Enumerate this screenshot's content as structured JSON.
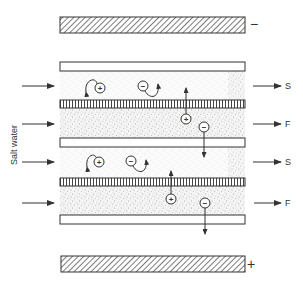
{
  "diagram": {
    "inlet_label": "Salt water",
    "electrodes": {
      "top": {
        "role": "cathode",
        "sign": "−"
      },
      "bottom": {
        "role": "anode",
        "sign": "+"
      }
    },
    "membranes": [
      {
        "type": "anion-exchange",
        "style": "plain"
      },
      {
        "type": "cation-exchange",
        "style": "vertical-hatch"
      },
      {
        "type": "anion-exchange",
        "style": "plain"
      },
      {
        "type": "cation-exchange",
        "style": "vertical-hatch"
      },
      {
        "type": "anion-exchange",
        "style": "plain"
      }
    ],
    "channels": [
      {
        "outlet_label": "S",
        "meaning": "salt (concentrate)"
      },
      {
        "outlet_label": "F",
        "meaning": "fresh (dilute)"
      },
      {
        "outlet_label": "S",
        "meaning": "salt (concentrate)"
      },
      {
        "outlet_label": "F",
        "meaning": "fresh (dilute)"
      }
    ],
    "ions": {
      "cation_sign": "+",
      "anion_sign": "−"
    },
    "colors": {
      "line": "#333333",
      "stipple": "#8a8a8a",
      "background": "#ffffff"
    }
  }
}
